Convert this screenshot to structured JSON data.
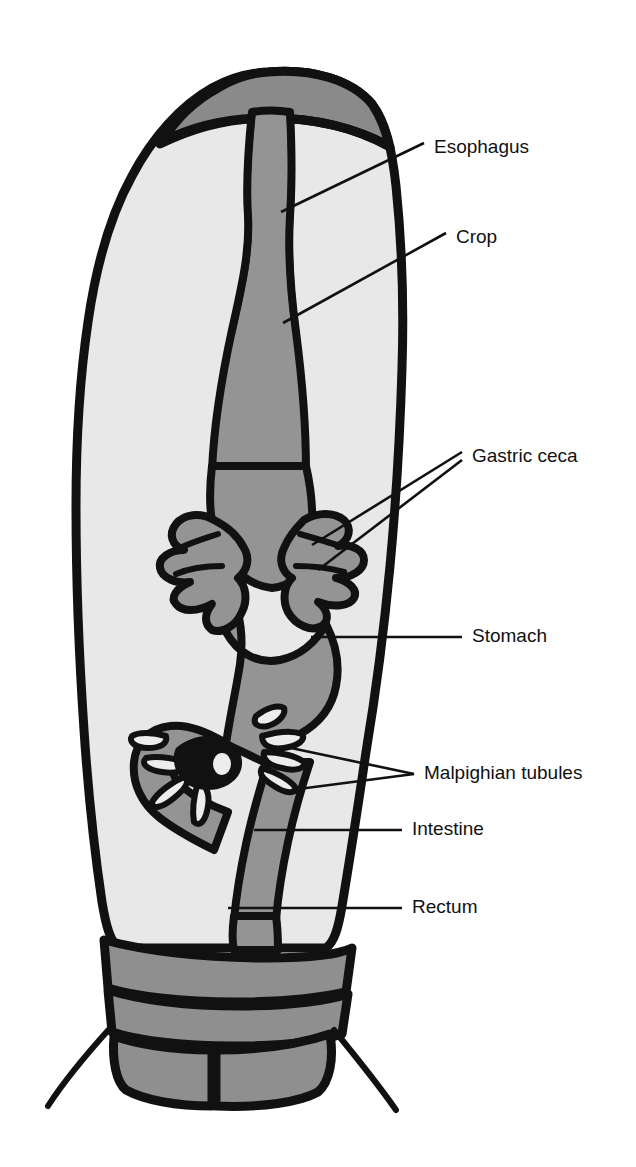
{
  "figure": {
    "background_color": "#ffffff"
  },
  "colors": {
    "outline": "#111111",
    "body_fill": "#e8e8e8",
    "gut_fill": "#949494",
    "segment_fill": "#8f8f8f",
    "head_fill": "#8a8a8a",
    "tubule_fill": "#ededed",
    "label_text": "#111111"
  },
  "labels": [
    {
      "id": "esophagus",
      "name": "Esophagus",
      "text_x": 434,
      "text_y": 148,
      "leaders": [
        {
          "points": "281,212 424,143"
        }
      ]
    },
    {
      "id": "crop",
      "name": "Crop",
      "text_x": 456,
      "text_y": 238,
      "leaders": [
        {
          "points": "283,323 446,233"
        }
      ]
    },
    {
      "id": "gastric-ceca",
      "name": "Gastric ceca",
      "text_x": 472,
      "text_y": 457,
      "leaders": [
        {
          "points": "312,545 462,452"
        },
        {
          "points": "318,570 462,460"
        }
      ]
    },
    {
      "id": "stomach",
      "name": "Stomach",
      "text_x": 472,
      "text_y": 637,
      "leaders": [
        {
          "points": "311,637 462,637"
        }
      ]
    },
    {
      "id": "malpighian-tubules",
      "name": "Malpighian tubules",
      "text_x": 424,
      "text_y": 774,
      "leaders": [
        {
          "points": "291,748 414,774"
        },
        {
          "points": "291,790 414,774"
        }
      ]
    },
    {
      "id": "intestine",
      "name": "Intestine",
      "text_x": 412,
      "text_y": 830,
      "leaders": [
        {
          "points": "254,830 402,830"
        }
      ]
    },
    {
      "id": "rectum",
      "name": "Rectum",
      "text_x": 412,
      "text_y": 908,
      "leaders": [
        {
          "points": "228,908 402,908"
        }
      ]
    }
  ]
}
